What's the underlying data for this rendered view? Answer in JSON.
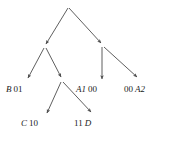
{
  "diagram": {
    "type": "binary-tree-with-arrows",
    "line_color": "#4d4d4d",
    "text_color": "#1c1c1c",
    "nodes": [
      {
        "id": "root",
        "x": 68,
        "y": 7,
        "label": ""
      },
      {
        "id": "n-left",
        "x": 45,
        "y": 47,
        "label": ""
      },
      {
        "id": "n-right",
        "x": 102,
        "y": 45,
        "label": ""
      },
      {
        "id": "n-mid",
        "x": 62,
        "y": 80,
        "label": ""
      }
    ],
    "edges": [
      {
        "from": "root",
        "to": "n-left",
        "x1": 68,
        "y1": 8,
        "x2": 46,
        "y2": 44
      },
      {
        "from": "root",
        "to": "n-right",
        "x1": 69,
        "y1": 8,
        "x2": 101,
        "y2": 43
      },
      {
        "from": "n-left",
        "to": "leaf-b",
        "x1": 44,
        "y1": 48,
        "x2": 28,
        "y2": 78
      },
      {
        "from": "n-left",
        "to": "n-mid",
        "x1": 46,
        "y1": 48,
        "x2": 61,
        "y2": 77
      },
      {
        "from": "n-right",
        "to": "leaf-a1",
        "x1": 102,
        "y1": 47,
        "x2": 102,
        "y2": 79
      },
      {
        "from": "n-right",
        "to": "leaf-a2",
        "x1": 104,
        "y1": 47,
        "x2": 137,
        "y2": 77
      },
      {
        "from": "n-mid",
        "to": "leaf-c",
        "x1": 61,
        "y1": 82,
        "x2": 47,
        "y2": 113
      },
      {
        "from": "n-mid",
        "to": "leaf-d",
        "x1": 63,
        "y1": 82,
        "x2": 91,
        "y2": 112
      }
    ],
    "labels": [
      {
        "id": "leaf-b",
        "symbol": "B",
        "code": "01",
        "order": "symbol-first",
        "x": 6,
        "y": 85
      },
      {
        "id": "leaf-a1",
        "symbol": "A1",
        "code": "00",
        "order": "symbol-first",
        "x": 76,
        "y": 85
      },
      {
        "id": "leaf-a2",
        "symbol": "A2",
        "code": "00",
        "order": "code-first",
        "x": 124,
        "y": 85
      },
      {
        "id": "leaf-c",
        "symbol": "C",
        "code": "10",
        "order": "symbol-first",
        "x": 21,
        "y": 119
      },
      {
        "id": "leaf-d",
        "symbol": "D",
        "code": "11",
        "order": "code-first",
        "x": 74,
        "y": 119
      }
    ]
  }
}
